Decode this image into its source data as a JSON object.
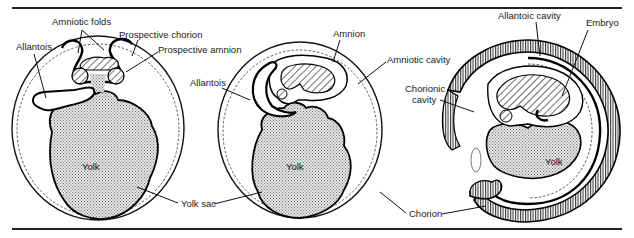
{
  "figure": {
    "type": "embryology-diagram",
    "panels": [
      {
        "id": "early",
        "labels": {
          "amniotic_folds": "Amniotic folds",
          "prospective_chorion": "Prospective chorion",
          "prospective_amnion": "Prospective amnion",
          "allantois": "Allantois",
          "yolk": "Yolk"
        }
      },
      {
        "id": "middle",
        "labels": {
          "amnion": "Amnion",
          "allantois": "Allantois",
          "amniotic_cavity": "Amniotic cavity",
          "yolk": "Yolk"
        }
      },
      {
        "id": "late",
        "labels": {
          "allantoic_cavity": "Allantoic cavity",
          "embryo": "Embryo",
          "chorionic_cavity_line1": "Chorionic",
          "chorionic_cavity_line2": "cavity",
          "yolk": "Yolk"
        }
      }
    ],
    "shared_labels": {
      "yolk_sac": "Yolk sac",
      "chorion": "Chorion"
    },
    "colors": {
      "ink": "#111111",
      "yolk_fill": "#c8c8c8",
      "background": "#ffffff"
    }
  }
}
